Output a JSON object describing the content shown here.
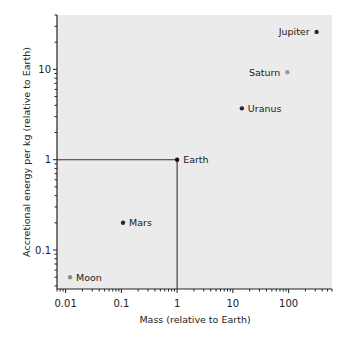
{
  "chart_data": {
    "type": "scatter",
    "title": "",
    "xlabel": "Mass (relative to Earth)",
    "ylabel": "Accretional energy per kg (relative to Earth)",
    "xscale": "log",
    "yscale": "log",
    "xlim": [
      0.007,
      600
    ],
    "ylim": [
      0.037,
      40
    ],
    "xticks": [
      0.01,
      0.1,
      1,
      10,
      100
    ],
    "xtick_labels": [
      "0.01",
      "0.1",
      "1",
      "10",
      "100"
    ],
    "yticks": [
      0.1,
      1,
      10
    ],
    "ytick_labels": [
      "0.1",
      "1",
      "10"
    ],
    "grid": false,
    "legend": "none",
    "points": [
      {
        "name": "Moon",
        "x": 0.012,
        "y": 0.05,
        "color": "#8a8a8a",
        "label_side": "right"
      },
      {
        "name": "Mars",
        "x": 0.107,
        "y": 0.2,
        "color": "#2a2a2a",
        "label_side": "right"
      },
      {
        "name": "Earth",
        "x": 1,
        "y": 1,
        "color": "#111111",
        "label_side": "right"
      },
      {
        "name": "Uranus",
        "x": 14.5,
        "y": 3.7,
        "color": "#2a2a2a",
        "label_side": "right"
      },
      {
        "name": "Saturn",
        "x": 95,
        "y": 9.3,
        "color": "#9a9a9a",
        "label_side": "left"
      },
      {
        "name": "Jupiter",
        "x": 318,
        "y": 26,
        "color": "#2a2a2a",
        "label_side": "left"
      }
    ],
    "reference_lines": [
      {
        "type": "horizontal",
        "y": 1,
        "from_x": "axis",
        "to_x": 1
      },
      {
        "type": "vertical",
        "x": 1,
        "from_y": "axis",
        "to_y": 1
      }
    ],
    "colors": {
      "plot_background": "#ebebeb",
      "axis": "#222222"
    }
  }
}
